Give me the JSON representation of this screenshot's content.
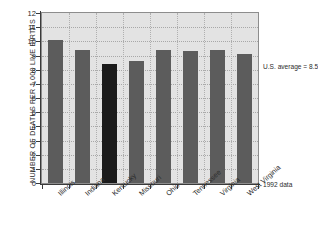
{
  "chart_data": {
    "type": "bar",
    "title": "",
    "xlabel": "",
    "ylabel": "NUMBER OF DEATHS PER 1,000 LIVE BIRTHS",
    "ylim": [
      0,
      12
    ],
    "yticks": [
      0,
      1,
      2,
      3,
      4,
      5,
      6,
      7,
      8,
      9,
      10,
      11,
      12
    ],
    "ytick_labels": [
      "0",
      "1",
      "2",
      "3",
      "4",
      "5",
      "6",
      "7",
      "8",
      "9",
      "10",
      "11",
      "12"
    ],
    "grid": true,
    "legend": "none",
    "categories": [
      "Illinois",
      "Indiana",
      "Kentucky",
      "Missouri",
      "Ohio",
      "Tennessee",
      "Virginia",
      "West Virginia"
    ],
    "values": [
      10.1,
      9.4,
      8.4,
      8.6,
      9.4,
      9.3,
      9.4,
      9.1
    ],
    "highlight_category": "Kentucky",
    "bar_color": "#5c5c5c",
    "highlight_color": "#1b1b1b",
    "plot_background": "#e3e3e3",
    "annotations": [
      {
        "id": "us-average",
        "text": "U.S. average = 8.5",
        "value": 8.5
      },
      {
        "id": "year",
        "text": "1992 data"
      }
    ]
  }
}
